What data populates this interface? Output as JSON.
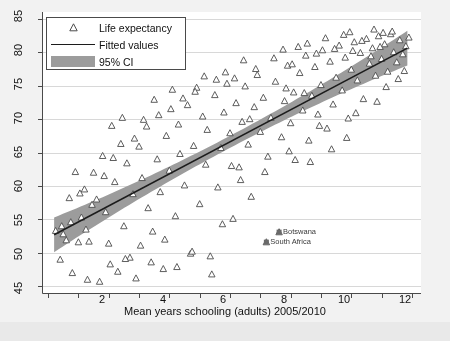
{
  "chart_data": {
    "type": "scatter",
    "title": "",
    "xlabel": "Mean years schooling (adults) 2005/2010",
    "ylabel": "",
    "xlim": [
      0.8,
      13.3
    ],
    "ylim": [
      44.0,
      86.0
    ],
    "xticks": [
      1,
      2,
      3,
      4,
      5,
      6,
      7,
      8,
      9,
      10,
      11,
      12,
      13
    ],
    "xtick_labels": [
      "",
      "2",
      "",
      "4",
      "",
      "6",
      "",
      "8",
      "",
      "10",
      "",
      "12",
      ""
    ],
    "yticks": [
      45,
      50,
      55,
      60,
      65,
      70,
      75,
      80,
      85
    ],
    "ytick_labels": [
      "45",
      "50",
      "55",
      "60",
      "65",
      "70",
      "75",
      "80",
      "85"
    ],
    "grid": "horizontal",
    "legend_position": "top-left",
    "legend": [
      {
        "label": "Life expectancy",
        "key": "triangle-marker"
      },
      {
        "label": "Fitted values",
        "key": "line"
      },
      {
        "label": "95% CI",
        "key": "band"
      }
    ],
    "colors": {
      "marker_edge": "#4c4c4c",
      "marker_fill": "#ffffff",
      "fit_line": "#1c1c1c",
      "ci_band": "#9c9c9c",
      "grid": "#d8d8d8",
      "axis": "#4a4a4a",
      "plot_background": "#ffffff",
      "page_background": "#e9e9e9"
    },
    "fit": {
      "x_start": 1.2,
      "y_start": 52.7,
      "x_end": 12.85,
      "y_end": 80.6,
      "ci_half_width_center": 0.9,
      "ci_half_width_ends": 2.6
    },
    "annotations": [
      {
        "label": "Botswana",
        "x": 8.62,
        "y": 53.1
      },
      {
        "label": "South Africa",
        "x": 8.2,
        "y": 51.6
      }
    ],
    "series": [
      {
        "name": "Life expectancy",
        "marker": "triangle-up-open",
        "points": [
          [
            1.25,
            53.3
          ],
          [
            1.4,
            49.0
          ],
          [
            1.45,
            54.0
          ],
          [
            1.5,
            52.8
          ],
          [
            1.6,
            51.9
          ],
          [
            1.7,
            58.2
          ],
          [
            1.8,
            47.0
          ],
          [
            1.9,
            62.1
          ],
          [
            2.0,
            51.6
          ],
          [
            2.1,
            55.3
          ],
          [
            2.2,
            59.5
          ],
          [
            2.3,
            46.0
          ],
          [
            2.35,
            51.7
          ],
          [
            2.5,
            62.0
          ],
          [
            2.6,
            58.0
          ],
          [
            2.7,
            45.7
          ],
          [
            2.8,
            64.5
          ],
          [
            2.9,
            56.1
          ],
          [
            3.0,
            51.4
          ],
          [
            3.05,
            48.3
          ],
          [
            3.1,
            69.0
          ],
          [
            3.2,
            60.6
          ],
          [
            3.3,
            47.2
          ],
          [
            3.4,
            66.3
          ],
          [
            3.5,
            54.0
          ],
          [
            3.6,
            63.4
          ],
          [
            3.7,
            49.3
          ],
          [
            3.8,
            58.8
          ],
          [
            3.9,
            46.2
          ],
          [
            4.0,
            65.9
          ],
          [
            4.1,
            61.2
          ],
          [
            4.15,
            69.9
          ],
          [
            4.3,
            56.7
          ],
          [
            4.4,
            48.6
          ],
          [
            4.5,
            72.9
          ],
          [
            4.6,
            64.0
          ],
          [
            4.7,
            59.1
          ],
          [
            4.8,
            47.6
          ],
          [
            4.9,
            67.5
          ],
          [
            5.0,
            62.3
          ],
          [
            5.1,
            74.4
          ],
          [
            5.2,
            55.5
          ],
          [
            5.3,
            69.2
          ],
          [
            5.35,
            64.8
          ],
          [
            5.5,
            60.1
          ],
          [
            5.6,
            72.1
          ],
          [
            5.7,
            49.9
          ],
          [
            5.8,
            66.0
          ],
          [
            5.9,
            74.7
          ],
          [
            6.0,
            57.3
          ],
          [
            6.1,
            70.4
          ],
          [
            6.2,
            63.2
          ],
          [
            6.25,
            68.4
          ],
          [
            6.4,
            46.8
          ],
          [
            6.5,
            73.6
          ],
          [
            6.6,
            59.8
          ],
          [
            6.7,
            65.7
          ],
          [
            6.8,
            71.0
          ],
          [
            6.9,
            75.3
          ],
          [
            7.0,
            67.9
          ],
          [
            7.1,
            55.1
          ],
          [
            7.2,
            72.4
          ],
          [
            7.3,
            62.8
          ],
          [
            7.4,
            69.6
          ],
          [
            7.5,
            74.9
          ],
          [
            7.6,
            66.2
          ],
          [
            7.7,
            58.4
          ],
          [
            7.8,
            71.8
          ],
          [
            7.9,
            76.6
          ],
          [
            8.0,
            68.1
          ],
          [
            8.1,
            73.2
          ],
          [
            8.2,
            51.6
          ],
          [
            8.25,
            64.4
          ],
          [
            8.35,
            70.2
          ],
          [
            8.5,
            75.6
          ],
          [
            8.62,
            53.1
          ],
          [
            8.7,
            67.3
          ],
          [
            8.8,
            72.7
          ],
          [
            8.9,
            78.0
          ],
          [
            9.0,
            69.4
          ],
          [
            9.1,
            74.0
          ],
          [
            9.15,
            63.9
          ],
          [
            9.3,
            76.9
          ],
          [
            9.4,
            71.3
          ],
          [
            9.5,
            79.5
          ],
          [
            9.6,
            66.8
          ],
          [
            9.7,
            73.5
          ],
          [
            9.8,
            77.8
          ],
          [
            9.9,
            70.7
          ],
          [
            10.0,
            75.1
          ],
          [
            10.05,
            80.3
          ],
          [
            10.2,
            68.6
          ],
          [
            10.3,
            78.6
          ],
          [
            10.4,
            72.2
          ],
          [
            10.5,
            76.2
          ],
          [
            10.6,
            81.0
          ],
          [
            10.7,
            74.3
          ],
          [
            10.8,
            79.2
          ],
          [
            10.9,
            70.1
          ],
          [
            11.0,
            77.4
          ],
          [
            11.1,
            81.5
          ],
          [
            11.2,
            75.8
          ],
          [
            11.3,
            79.9
          ],
          [
            11.4,
            73.0
          ],
          [
            11.5,
            82.0
          ],
          [
            11.6,
            78.3
          ],
          [
            11.7,
            80.6
          ],
          [
            11.8,
            76.5
          ],
          [
            11.9,
            82.4
          ],
          [
            12.0,
            79.0
          ],
          [
            12.1,
            81.2
          ],
          [
            12.2,
            77.1
          ],
          [
            12.3,
            82.7
          ],
          [
            12.4,
            80.0
          ],
          [
            12.5,
            78.5
          ],
          [
            12.6,
            81.8
          ],
          [
            12.7,
            79.7
          ],
          [
            12.8,
            80.9
          ],
          [
            12.9,
            82.2
          ],
          [
            9.25,
            80.8
          ],
          [
            9.55,
            81.3
          ],
          [
            9.85,
            79.8
          ],
          [
            10.15,
            82.1
          ],
          [
            10.45,
            80.5
          ],
          [
            10.75,
            82.6
          ],
          [
            11.05,
            80.2
          ],
          [
            11.35,
            81.7
          ],
          [
            11.65,
            79.4
          ],
          [
            11.95,
            80.8
          ],
          [
            8.45,
            79.1
          ],
          [
            8.75,
            80.4
          ],
          [
            9.05,
            78.2
          ],
          [
            7.85,
            77.5
          ],
          [
            7.45,
            78.8
          ],
          [
            7.15,
            76.1
          ],
          [
            6.85,
            77.0
          ],
          [
            6.55,
            75.9
          ],
          [
            6.15,
            76.4
          ],
          [
            5.85,
            74.1
          ],
          [
            5.45,
            73.1
          ],
          [
            5.05,
            71.5
          ],
          [
            4.65,
            70.6
          ],
          [
            4.25,
            68.9
          ],
          [
            3.85,
            67.1
          ],
          [
            3.45,
            70.2
          ],
          [
            3.15,
            64.2
          ],
          [
            2.85,
            61.5
          ],
          [
            2.45,
            57.2
          ],
          [
            2.05,
            58.9
          ],
          [
            1.75,
            54.6
          ],
          [
            12.35,
            83.1
          ],
          [
            12.05,
            82.9
          ],
          [
            11.75,
            83.4
          ],
          [
            10.95,
            83.0
          ],
          [
            9.45,
            73.9
          ],
          [
            8.95,
            65.2
          ],
          [
            8.15,
            62.1
          ],
          [
            7.35,
            60.9
          ],
          [
            6.75,
            54.3
          ],
          [
            6.35,
            49.5
          ],
          [
            5.75,
            50.2
          ],
          [
            5.25,
            47.9
          ],
          [
            4.85,
            52.0
          ],
          [
            4.45,
            53.2
          ],
          [
            4.05,
            51.1
          ],
          [
            3.55,
            49.1
          ],
          [
            12.55,
            76.0
          ],
          [
            12.15,
            74.8
          ],
          [
            11.85,
            72.6
          ],
          [
            10.85,
            67.2
          ],
          [
            10.35,
            65.5
          ],
          [
            9.65,
            63.6
          ],
          [
            9.95,
            69.0
          ],
          [
            11.15,
            70.9
          ],
          [
            12.75,
            77.2
          ],
          [
            8.85,
            74.6
          ],
          [
            7.65,
            70.0
          ],
          [
            7.05,
            63.0
          ],
          [
            2.25,
            53.5
          ]
        ]
      }
    ]
  }
}
